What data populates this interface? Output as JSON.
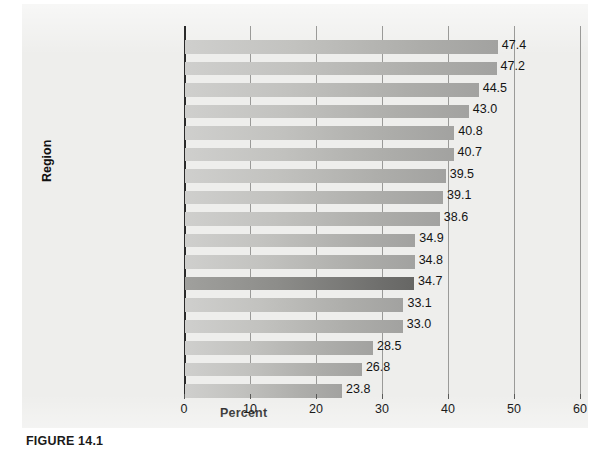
{
  "caption": "FIGURE 14.1",
  "chart_data": {
    "type": "bar",
    "orientation": "horizontal",
    "title": "",
    "xlabel": "Percent",
    "ylabel": "Region",
    "xlim": [
      0,
      60
    ],
    "xticks": [
      0,
      10,
      20,
      30,
      40,
      50,
      60
    ],
    "xtick_labels": [
      "0",
      "10",
      "20",
      "30",
      "40",
      "50",
      "60"
    ],
    "grid": "vertical",
    "legend": "none",
    "highlight_category": "Canada",
    "highlight_color": "#6f6f6d",
    "bar_color": "#b8b8b5",
    "background_color": "#eeeeec",
    "categories": [
      "Toronto",
      "Oshawa",
      "Hamilton",
      "Windsor",
      "Barrie",
      "St. Catharines–Niagara",
      "Brantford",
      "Abbotsford–Mission",
      "Vancouver",
      "Kitchener–Cambridge–\nWaterloo",
      "Winnipeg",
      "Canada",
      "Montréal",
      "Ottawa–Gatineau",
      "Calgary",
      "Edmonton",
      "Québec"
    ],
    "values": [
      47.4,
      47.2,
      44.5,
      43.0,
      40.8,
      40.7,
      39.5,
      39.1,
      38.6,
      34.9,
      34.8,
      34.7,
      33.1,
      33.0,
      28.5,
      26.8,
      23.8
    ],
    "value_labels": [
      "47.4",
      "47.2",
      "44.5",
      "43.0",
      "40.8",
      "40.7",
      "39.5",
      "39.1",
      "38.6",
      "34.9",
      "34.8",
      "34.7",
      "33.1",
      "33.0",
      "28.5",
      "26.8",
      "23.8"
    ]
  }
}
